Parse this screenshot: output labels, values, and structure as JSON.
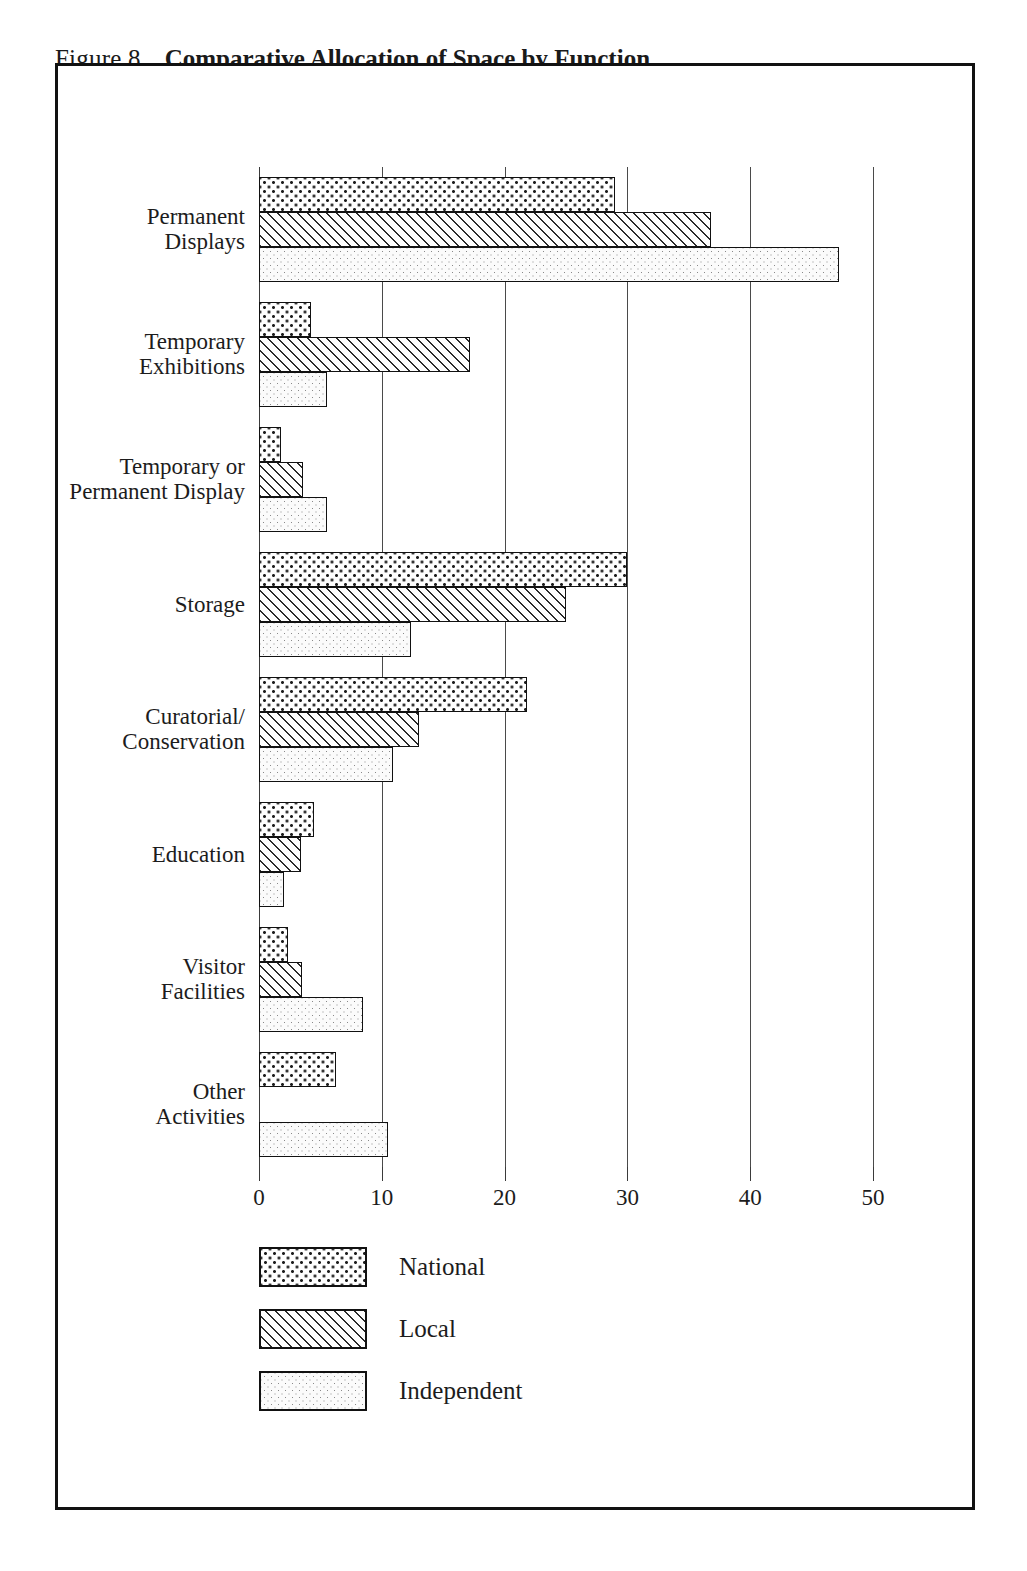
{
  "figure": {
    "number": "Figure 8",
    "title": "Comparative Allocation of Space by Function"
  },
  "chart_data": {
    "type": "bar",
    "orientation": "horizontal",
    "title": "Comparative Allocation of Space by Function",
    "xlabel": "",
    "ylabel": "",
    "xlim": [
      0,
      50
    ],
    "xticks": [
      0,
      10,
      20,
      30,
      40,
      50
    ],
    "xtick_labels": [
      "0",
      "10",
      "20",
      "30",
      "40",
      "50"
    ],
    "grid": "vertical gridlines at each x tick",
    "legend_position": "below axis, left",
    "categories": [
      "Permanent Displays",
      "Temporary Exhibitions",
      "Temporary or Permanent Display",
      "Storage",
      "Curatorial/ Conservation",
      "Education",
      "Visitor Facilities",
      "Other Activities"
    ],
    "category_label_lines": [
      [
        "Permanent",
        "Displays"
      ],
      [
        "Temporary",
        "Exhibitions"
      ],
      [
        "Temporary or",
        "Permanent Display"
      ],
      [
        "Storage"
      ],
      [
        "Curatorial/",
        "Conservation"
      ],
      [
        "Education"
      ],
      [
        "Visitor",
        "Facilities"
      ],
      [
        "Other",
        "Activities"
      ]
    ],
    "series": [
      {
        "name": "National",
        "pattern": "coarse-dots",
        "values": [
          29.0,
          4.2,
          1.8,
          30.0,
          21.8,
          4.5,
          2.4,
          6.3
        ]
      },
      {
        "name": "Local",
        "pattern": "diagonal-hatch",
        "values": [
          36.8,
          17.2,
          3.6,
          25.0,
          13.0,
          3.4,
          3.5,
          0.0
        ]
      },
      {
        "name": "Independent",
        "pattern": "fine-dots",
        "values": [
          47.2,
          5.5,
          5.5,
          12.4,
          10.9,
          2.0,
          8.5,
          10.5
        ]
      }
    ]
  },
  "legend": {
    "items": [
      {
        "label": "National",
        "pattern": "coarse-dots"
      },
      {
        "label": "Local",
        "pattern": "diagonal-hatch"
      },
      {
        "label": "Independent",
        "pattern": "fine-dots"
      }
    ]
  }
}
